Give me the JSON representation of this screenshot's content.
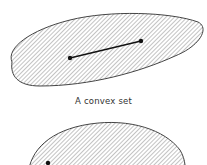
{
  "figure": {
    "convex_set": {
      "caption": "A convex set",
      "segment": {
        "p1": [
          70,
          57
        ],
        "p2": [
          141,
          41
        ]
      }
    },
    "nonconvex_set": {
      "caption": "",
      "visible_point": [
        48,
        163
      ]
    },
    "colors": {
      "outline": "#444444",
      "hatch": "#7a7a7a",
      "segment": "#111111"
    }
  }
}
